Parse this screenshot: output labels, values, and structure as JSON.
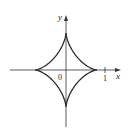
{
  "figure": {
    "type": "astroid",
    "equation": "x^(2/3) + y^(2/3) = 1",
    "axes": {
      "x_label": "x",
      "y_label": "y",
      "origin_label": "0",
      "tick_label": "1"
    },
    "colors": {
      "curve": "#2a2a2a",
      "axis": "#333333",
      "background": "#ffffff"
    }
  }
}
